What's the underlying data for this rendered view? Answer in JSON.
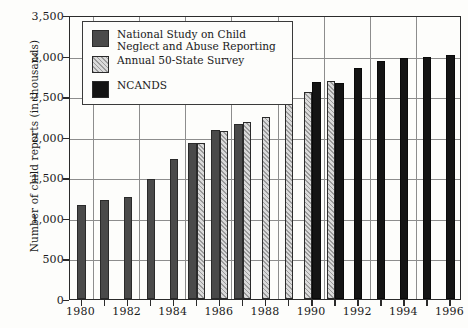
{
  "chart_data": {
    "type": "bar",
    "title": "",
    "xlabel": "",
    "ylabel": "Number of child reports (in thousands)",
    "ylim": [
      0,
      3500
    ],
    "ytick_labels": [
      "0",
      "500",
      "1,000",
      "1,500",
      "2,000",
      "2,500",
      "3,000",
      "3,500"
    ],
    "ytick_values": [
      0,
      500,
      1000,
      1500,
      2000,
      2500,
      3000,
      3500
    ],
    "grid": true,
    "legend_position": "upper-left-inside",
    "categories": [
      "1980",
      "1981",
      "1982",
      "1983",
      "1984",
      "1985",
      "1986",
      "1987",
      "1988",
      "1989",
      "1990",
      "1991",
      "1992",
      "1993",
      "1994",
      "1995",
      "1996"
    ],
    "xtick_labels": [
      "1980",
      "",
      "1982",
      "",
      "1984",
      "",
      "1986",
      "",
      "1988",
      "",
      "1990",
      "",
      "1992",
      "",
      "1994",
      "",
      "1996"
    ],
    "series": [
      {
        "name": "National Study on Child Neglect and Abuse Reporting",
        "key": "national_study",
        "style": "dark-gray-solid",
        "color": "#4a4a4a",
        "values": [
          1154,
          1226,
          1262,
          1477,
          1727,
          1928,
          2086,
          2157,
          null,
          null,
          null,
          null,
          null,
          null,
          null,
          null,
          null
        ]
      },
      {
        "name": "Annual 50-State Survey",
        "key": "annual_50_state",
        "style": "gray-hatched",
        "color": "#9b9b9b",
        "values": [
          null,
          null,
          null,
          null,
          null,
          1919,
          2068,
          2178,
          2243,
          2407,
          2557,
          2684,
          null,
          null,
          null,
          null,
          null
        ]
      },
      {
        "name": "NCANDS",
        "key": "ncands",
        "style": "black-solid",
        "color": "#141414",
        "values": [
          null,
          null,
          null,
          null,
          null,
          null,
          null,
          null,
          null,
          null,
          2669,
          2661,
          2851,
          2936,
          2974,
          2983,
          3010
        ]
      }
    ]
  },
  "legend": {
    "items": [
      {
        "label": "National Study on Child\nNeglect and Abuse Reporting",
        "swatch": "dark-gray-solid"
      },
      {
        "label": "Annual 50-State Survey",
        "swatch": "gray-hatched"
      },
      {
        "label": "NCANDS",
        "swatch": "black-solid"
      }
    ]
  },
  "axes": {
    "y_title": "Number of child reports (in thousands)"
  }
}
